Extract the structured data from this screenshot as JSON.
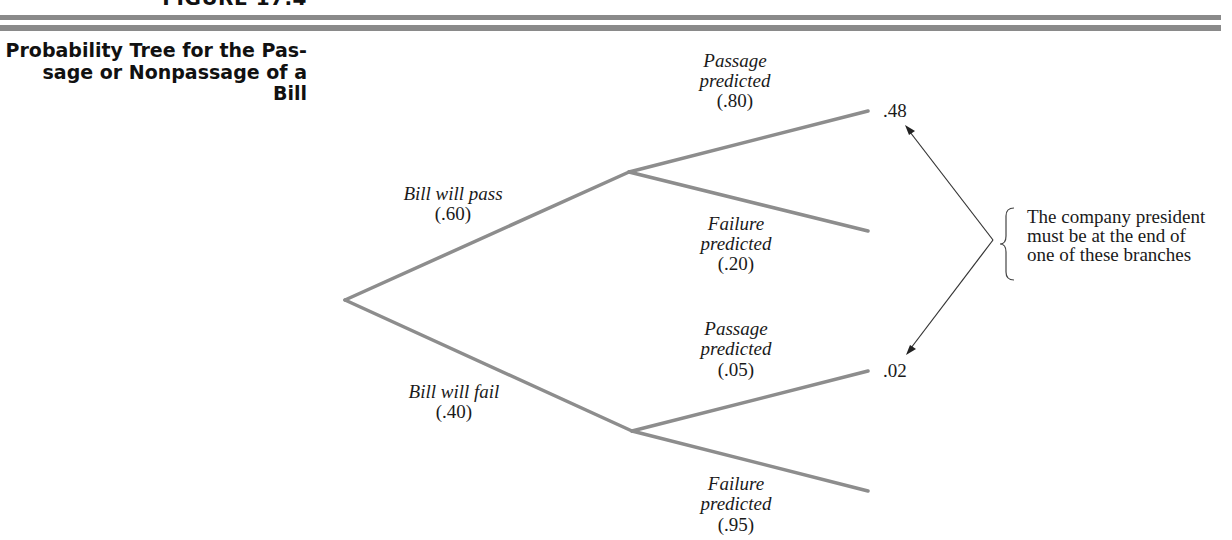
{
  "figure": {
    "label": "FIGURE 17.4",
    "caption_lines": [
      "Probability Tree for the Pas-",
      "sage or Nonpassage of a",
      "Bill"
    ]
  },
  "tree": {
    "root": {
      "branches": [
        {
          "label": "Bill will pass",
          "prob": "(.60)"
        },
        {
          "label": "Bill will fail",
          "prob": "(.40)"
        }
      ]
    },
    "pass_node": {
      "branches": [
        {
          "label_line1": "Passage",
          "label_line2": "predicted",
          "prob": "(.80)",
          "outcome": ".48"
        },
        {
          "label_line1": "Failure",
          "label_line2": "predicted",
          "prob": "(.20)",
          "outcome": ""
        }
      ]
    },
    "fail_node": {
      "branches": [
        {
          "label_line1": "Passage",
          "label_line2": "predicted",
          "prob": "(.05)",
          "outcome": ".02"
        },
        {
          "label_line1": "Failure",
          "label_line2": "predicted",
          "prob": "(.95)",
          "outcome": ""
        }
      ]
    }
  },
  "annotation": {
    "lines": [
      "The company president",
      "must be at the end of",
      "one of these branches"
    ]
  },
  "colors": {
    "branch": "#8d8d8d",
    "rule": "#8a8a8a",
    "text": "#1a1a1a"
  }
}
